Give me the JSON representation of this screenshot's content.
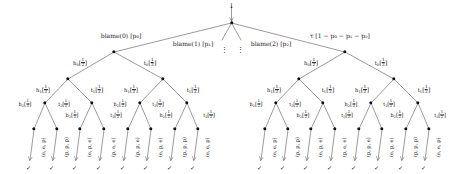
{
  "diagram": {
    "root": {
      "incoming_label": "↓"
    },
    "edge_labels": {
      "blame0": "blame(0) [p₀]",
      "blame1": "blame(1) [p₁]",
      "blame2": "blame(2) [p₂]",
      "tau": "τ [1 − p₀ − p₁ − p₂]",
      "ellipsis": "⋮"
    },
    "coin_labels": {
      "h0": "h",
      "h0_idx": "0",
      "t0": "t",
      "t0_idx": "0",
      "h1": "h",
      "h1_idx": "1",
      "t1": "t",
      "t1_idx": "1",
      "h2": "h",
      "h2_idx": "2",
      "t2": "t",
      "t2_idx": "2",
      "prob_num": "1",
      "prob_den": "2",
      "bracket_open": "[",
      "bracket_close": "]"
    },
    "leaf_check": "✓",
    "colors": {
      "ink": "#1a1a1a",
      "node": "#111111",
      "background": "#ffffff"
    },
    "left_subtree_leaves": [
      "(e, e, p)",
      "(p, p, p)",
      "(e, p, e)",
      "(p, e, e)",
      "(p, p, e)",
      "(e, p, e)",
      "(p, p, p)",
      "(e, e, p)"
    ],
    "right_subtree_leaves": [
      "(e, e, p)",
      "(p, p, p)",
      "(e, p, e)",
      "(p, e, e)",
      "(p, p, e)",
      "(e, p, e)",
      "(p, p, p)",
      "(e, e, p)"
    ]
  }
}
